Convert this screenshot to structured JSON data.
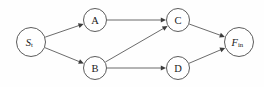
{
  "diagram": {
    "type": "directed-acyclic-graph",
    "background_color": "#fefefe",
    "node_stroke_color": "#4a4a4a",
    "edge_color": "#5a5a5a",
    "arrow_color": "#3c3c3c",
    "label_color": "#1a1a1a",
    "nodes": [
      {
        "id": "st",
        "label": "S",
        "subscript": "t",
        "italic": true,
        "cx": 31,
        "cy": 42,
        "r": 14.5
      },
      {
        "id": "a",
        "label": "A",
        "subscript": "",
        "italic": false,
        "cx": 95,
        "cy": 20,
        "r": 11.5
      },
      {
        "id": "b",
        "label": "B",
        "subscript": "",
        "italic": false,
        "cx": 95,
        "cy": 68,
        "r": 11.5
      },
      {
        "id": "c",
        "label": "C",
        "subscript": "",
        "italic": false,
        "cx": 178,
        "cy": 20,
        "r": 11.5
      },
      {
        "id": "d",
        "label": "D",
        "subscript": "",
        "italic": false,
        "cx": 178,
        "cy": 68,
        "r": 11.5
      },
      {
        "id": "fin",
        "label": "F",
        "subscript": "in",
        "italic": true,
        "cx": 239,
        "cy": 42,
        "r": 14.5
      }
    ],
    "edges": [
      {
        "id": "st-a",
        "from": "st",
        "to": "a",
        "directed": true
      },
      {
        "id": "st-b",
        "from": "st",
        "to": "b",
        "directed": true
      },
      {
        "id": "a-c",
        "from": "a",
        "to": "c",
        "directed": true
      },
      {
        "id": "b-c",
        "from": "b",
        "to": "c",
        "directed": true
      },
      {
        "id": "b-d",
        "from": "b",
        "to": "d",
        "directed": true
      },
      {
        "id": "c-fin",
        "from": "c",
        "to": "fin",
        "directed": true
      },
      {
        "id": "d-fin",
        "from": "d",
        "to": "fin",
        "directed": true
      }
    ]
  }
}
